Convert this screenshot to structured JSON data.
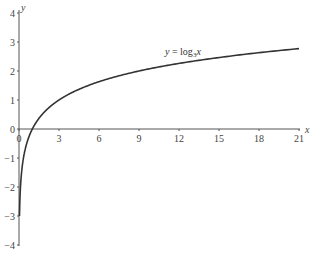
{
  "chart_data": {
    "type": "line",
    "title": "",
    "xlabel": "x",
    "ylabel": "y",
    "xlim": [
      0,
      21
    ],
    "ylim": [
      -4,
      4
    ],
    "x_ticks": [
      "0",
      "3",
      "6",
      "9",
      "12",
      "15",
      "18",
      "21"
    ],
    "y_ticks": [
      "4",
      "3",
      "2",
      "1",
      "0",
      "-1",
      "-2",
      "-3",
      "-4"
    ],
    "grid": false,
    "legend": null,
    "annotations": [
      {
        "text": "y = log3x",
        "x": 12,
        "y": 2.4
      }
    ],
    "series": [
      {
        "name": "y = log3 x",
        "x": [
          0.037,
          0.1,
          0.2,
          0.333,
          0.5,
          1,
          2,
          3,
          4.5,
          6,
          9,
          12,
          15,
          18,
          21
        ],
        "y": [
          -3.0,
          -2.1,
          -1.46,
          -1.0,
          -0.63,
          0,
          0.63,
          1.0,
          1.37,
          1.63,
          2.0,
          2.26,
          2.46,
          2.63,
          2.77
        ]
      }
    ]
  },
  "labels": {
    "x_axis": "x",
    "y_axis": "y",
    "annotation_y": "y",
    "annotation_eq": " = log",
    "annotation_sub": "3",
    "annotation_x": "x"
  },
  "colors": {
    "axis": "#555555",
    "curve": "#333333"
  }
}
